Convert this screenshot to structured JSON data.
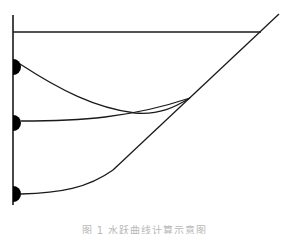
{
  "figure": {
    "caption": "图 1   水跃曲线计算示意图",
    "stroke_color": "#1a1a1a",
    "fill_color": "#000000",
    "wall": {
      "x": 13,
      "y1": 15,
      "y2": 205
    },
    "top_line": {
      "x1": 13,
      "y1": 32,
      "x2": 261,
      "y2": 32
    },
    "diagonal": {
      "x1": 279,
      "y1": 14,
      "x2": 113,
      "y2": 170
    },
    "gates": [
      {
        "label": "upper-gate",
        "cx": 13,
        "cy": 67,
        "r": 8
      },
      {
        "label": "middle-gate",
        "cx": 13,
        "cy": 123,
        "r": 8
      },
      {
        "label": "lower-gate",
        "cx": 13,
        "cy": 194,
        "r": 8
      }
    ],
    "curves": [
      {
        "label": "upper-curve",
        "d": "M 20 64 C 60 90, 95 108, 135 113 C 160 115, 175 107, 190 98"
      },
      {
        "label": "middle-curve",
        "d": "M 21 121 C 80 121, 130 118, 190 98"
      },
      {
        "label": "lower-curve",
        "d": "M 21 194 C 60 193, 88 188, 113 170"
      }
    ]
  }
}
